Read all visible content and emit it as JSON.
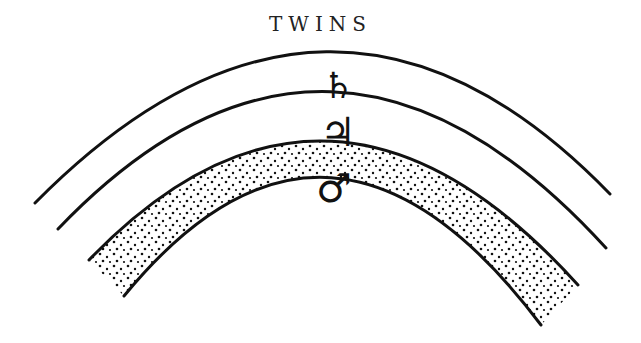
{
  "title": "TWINS",
  "diagram": {
    "arcs": [
      {
        "name": "outer-arc-1",
        "left": [
          35,
          203
        ],
        "top": [
          330,
          55
        ],
        "right": [
          610,
          194
        ]
      },
      {
        "name": "outer-arc-2",
        "left": [
          58,
          229
        ],
        "top": [
          330,
          90
        ],
        "right": [
          606,
          248
        ]
      },
      {
        "name": "band-outer-edge",
        "left": [
          89,
          260
        ],
        "top": [
          330,
          133
        ],
        "right": [
          578,
          285
        ]
      },
      {
        "name": "band-inner-edge",
        "left": [
          124,
          296
        ],
        "top": [
          330,
          183
        ],
        "right": [
          541,
          325
        ]
      }
    ],
    "band_fill": "stippled",
    "symbols": [
      {
        "name": "saturn",
        "glyph": "♄"
      },
      {
        "name": "jupiter",
        "glyph": "♃"
      },
      {
        "name": "mars",
        "glyph": "♂"
      }
    ],
    "ink_color": "#111111"
  }
}
